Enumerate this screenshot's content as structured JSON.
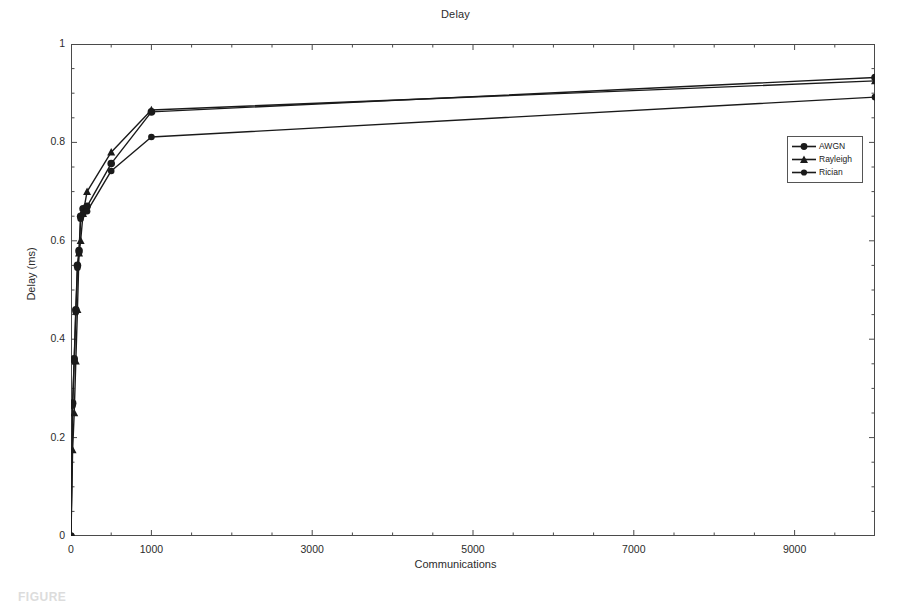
{
  "figure": {
    "caption_fragment": "FIGURE"
  },
  "chart_data": {
    "type": "line",
    "title": "Delay",
    "xlabel": "Communications",
    "ylabel": "Delay (ms)",
    "xlim": [
      0,
      10000
    ],
    "ylim": [
      0,
      1
    ],
    "xticks": [
      0,
      1000,
      3000,
      5000,
      7000,
      9000
    ],
    "xtick_labels": [
      "0",
      "1000",
      "3000",
      "5000",
      "7000",
      "9000"
    ],
    "yticks": [
      0,
      0.2,
      0.4,
      0.6,
      0.8,
      1
    ],
    "ytick_labels": [
      "0",
      "0.2",
      "0.4",
      "0.6",
      "0.8",
      "1"
    ],
    "grid": false,
    "minor_ticks": true,
    "legend_position": "right-upper-inside",
    "series": [
      {
        "name": "AWGN",
        "marker": "circle",
        "color": "#1a1a1a",
        "x": [
          0,
          20,
          40,
          60,
          80,
          100,
          120,
          150,
          200,
          500,
          1000,
          10000
        ],
        "y": [
          0.0,
          0.27,
          0.36,
          0.46,
          0.55,
          0.58,
          0.65,
          0.665,
          0.67,
          0.757,
          0.862,
          0.932
        ]
      },
      {
        "name": "Rayleigh",
        "marker": "triangle",
        "color": "#1a1a1a",
        "x": [
          0,
          20,
          40,
          60,
          80,
          100,
          120,
          150,
          200,
          500,
          1000,
          10000
        ],
        "y": [
          0.0,
          0.175,
          0.25,
          0.355,
          0.46,
          0.575,
          0.6,
          0.655,
          0.7,
          0.78,
          0.866,
          0.925
        ]
      },
      {
        "name": "Rician",
        "marker": "circle",
        "color": "#1a1a1a",
        "x": [
          0,
          20,
          40,
          60,
          80,
          100,
          120,
          150,
          200,
          500,
          1000,
          10000
        ],
        "y": [
          0.0,
          0.265,
          0.355,
          0.455,
          0.545,
          0.575,
          0.645,
          0.655,
          0.66,
          0.742,
          0.811,
          0.892
        ]
      }
    ]
  },
  "legend": {
    "items": [
      {
        "label": "AWGN"
      },
      {
        "label": "Rayleigh"
      },
      {
        "label": "Rician"
      }
    ]
  }
}
